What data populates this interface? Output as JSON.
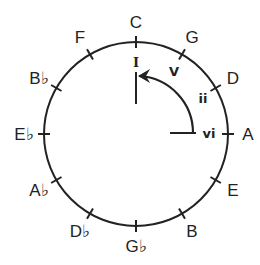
{
  "colors": {
    "stroke": "#222222",
    "background": "#ffffff"
  },
  "circle": {
    "cx": 136,
    "cy": 134,
    "r": 92
  },
  "notes": [
    {
      "label": "C",
      "angle": 0
    },
    {
      "label": "G",
      "angle": 30
    },
    {
      "label": "D",
      "angle": 60
    },
    {
      "label": "A",
      "angle": 90
    },
    {
      "label": "E",
      "angle": 120
    },
    {
      "label": "B",
      "angle": 150
    },
    {
      "label": "G♭",
      "angle": 180
    },
    {
      "label": "D♭",
      "angle": 210
    },
    {
      "label": "A♭",
      "angle": 240
    },
    {
      "label": "E♭",
      "angle": 270
    },
    {
      "label": "B♭",
      "angle": 300
    },
    {
      "label": "F",
      "angle": 330
    }
  ],
  "degrees": {
    "I": "I",
    "V": "V",
    "ii": "ii",
    "vi": "vi"
  },
  "arrow": {
    "from": "vi",
    "to": "I",
    "icon": "arrow-head-icon"
  }
}
